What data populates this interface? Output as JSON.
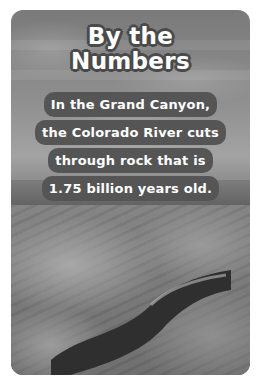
{
  "card": {
    "title_line1": "By the",
    "title_line2": "Numbers",
    "fact_lines": [
      "In the Grand Canyon,",
      "the Colorado River cuts",
      "through rock that is",
      "1.75 billion years old."
    ],
    "photo_subject": "Colorado River winding through canyon (grayscale photo)"
  }
}
